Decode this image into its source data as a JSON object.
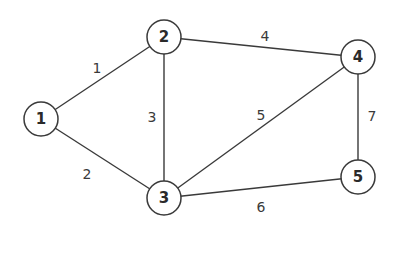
{
  "graph": {
    "type": "undirected-weighted",
    "nodes": [
      {
        "id": "1",
        "label": "1",
        "x": 41,
        "y": 119
      },
      {
        "id": "2",
        "label": "2",
        "x": 164,
        "y": 37
      },
      {
        "id": "3",
        "label": "3",
        "x": 164,
        "y": 198
      },
      {
        "id": "4",
        "label": "4",
        "x": 358,
        "y": 57
      },
      {
        "id": "5",
        "label": "5",
        "x": 358,
        "y": 177
      }
    ],
    "edges": [
      {
        "from": "1",
        "to": "2",
        "weight": "1",
        "label_x": 97,
        "label_y": 68
      },
      {
        "from": "1",
        "to": "3",
        "weight": "2",
        "label_x": 87,
        "label_y": 174
      },
      {
        "from": "2",
        "to": "3",
        "weight": "3",
        "label_x": 152,
        "label_y": 117
      },
      {
        "from": "2",
        "to": "4",
        "weight": "4",
        "label_x": 265,
        "label_y": 36
      },
      {
        "from": "3",
        "to": "4",
        "weight": "5",
        "label_x": 261,
        "label_y": 115
      },
      {
        "from": "3",
        "to": "5",
        "weight": "6",
        "label_x": 261,
        "label_y": 207
      },
      {
        "from": "4",
        "to": "5",
        "weight": "7",
        "label_x": 372,
        "label_y": 116
      }
    ],
    "node_radius": 17,
    "stroke_color": "#3a3a3a",
    "background": "#ffffff"
  }
}
